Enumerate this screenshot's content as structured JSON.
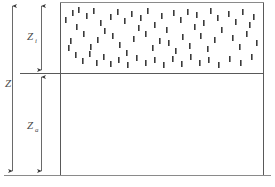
{
  "figure": {
    "name": "two-layer-depth-schematic",
    "background_color": "#ffffff",
    "line_color": "#595959",
    "stipple_color": "#3a3a3a",
    "label_color": "#4a4a4a"
  },
  "labels": {
    "upper_layer": {
      "symbol": "Z",
      "subscript": "i",
      "text": "Zi"
    },
    "interface": {
      "symbol": "Z",
      "subscript": "",
      "text": "Z"
    },
    "lower_layer": {
      "symbol": "Z",
      "subscript": "a",
      "text": "Za"
    }
  },
  "geometry": {
    "frame": {
      "left": 60,
      "right": 264,
      "top": 2,
      "bottom": 175
    },
    "divider_y": 73,
    "divider_left": 20,
    "divider_right": 264,
    "outer_arrow_x": 12,
    "inner_arrow_x": 41,
    "outer_arrow_top": 4,
    "outer_arrow_bottom": 174,
    "inner_arrow_upper_top": 4,
    "inner_arrow_upper_bottom": 72,
    "inner_arrow_lower_top": 74,
    "inner_arrow_lower_bottom": 174
  },
  "stipple": {
    "description": "scattered short vertical dashes in upper layer",
    "dash_width": 1.6,
    "dash_height": 6,
    "count": 74,
    "marks": [
      [
        72,
        10
      ],
      [
        78,
        7
      ],
      [
        86,
        13
      ],
      [
        93,
        8
      ],
      [
        100,
        20
      ],
      [
        76,
        24
      ],
      [
        83,
        31
      ],
      [
        70,
        38
      ],
      [
        90,
        44
      ],
      [
        97,
        37
      ],
      [
        104,
        28
      ],
      [
        110,
        14
      ],
      [
        117,
        9
      ],
      [
        124,
        18
      ],
      [
        131,
        11
      ],
      [
        138,
        25
      ],
      [
        112,
        33
      ],
      [
        119,
        42
      ],
      [
        126,
        50
      ],
      [
        133,
        36
      ],
      [
        140,
        15
      ],
      [
        147,
        8
      ],
      [
        154,
        22
      ],
      [
        161,
        13
      ],
      [
        145,
        31
      ],
      [
        152,
        45
      ],
      [
        159,
        38
      ],
      [
        166,
        27
      ],
      [
        173,
        10
      ],
      [
        180,
        17
      ],
      [
        187,
        9
      ],
      [
        194,
        24
      ],
      [
        168,
        40
      ],
      [
        175,
        48
      ],
      [
        182,
        34
      ],
      [
        189,
        43
      ],
      [
        196,
        12
      ],
      [
        203,
        20
      ],
      [
        210,
        8
      ],
      [
        217,
        15
      ],
      [
        200,
        33
      ],
      [
        207,
        46
      ],
      [
        214,
        37
      ],
      [
        221,
        27
      ],
      [
        228,
        11
      ],
      [
        235,
        19
      ],
      [
        242,
        9
      ],
      [
        249,
        22
      ],
      [
        232,
        35
      ],
      [
        239,
        44
      ],
      [
        246,
        31
      ],
      [
        253,
        14
      ],
      [
        256,
        40
      ],
      [
        65,
        17
      ],
      [
        68,
        45
      ],
      [
        75,
        52
      ],
      [
        82,
        58
      ],
      [
        89,
        51
      ],
      [
        96,
        60
      ],
      [
        103,
        54
      ],
      [
        110,
        61
      ],
      [
        118,
        57
      ],
      [
        127,
        62
      ],
      [
        136,
        55
      ],
      [
        145,
        60
      ],
      [
        154,
        57
      ],
      [
        163,
        62
      ],
      [
        172,
        56
      ],
      [
        181,
        61
      ],
      [
        190,
        54
      ],
      [
        199,
        60
      ],
      [
        208,
        57
      ],
      [
        218,
        62
      ],
      [
        229,
        56
      ],
      [
        240,
        60
      ],
      [
        251,
        54
      ]
    ]
  }
}
